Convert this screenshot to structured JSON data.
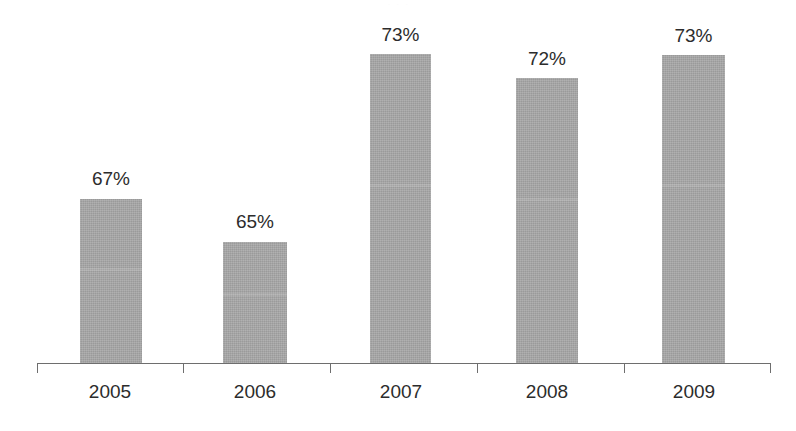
{
  "chart_data": {
    "type": "bar",
    "title": "",
    "subtitle": "",
    "xlabel": "",
    "ylabel": "",
    "categories": [
      "2005",
      "2006",
      "2007",
      "2008",
      "2009"
    ],
    "values": [
      67,
      65,
      73,
      72,
      73
    ],
    "value_labels": [
      "67%",
      "65%",
      "73%",
      "72%",
      "73%"
    ],
    "value_unit": "%",
    "ylim": [
      0,
      100
    ],
    "grid": false,
    "legend": null,
    "series": [
      {
        "name": "",
        "values": [
          67,
          65,
          73,
          72,
          73
        ]
      }
    ],
    "annotations": [],
    "colors": {
      "bar_fill": "#a8a8a8",
      "axis": "#6e6e6e",
      "text": "#2c2c2c",
      "background": "#ffffff"
    },
    "axis": {
      "show_y_axis": false,
      "show_x_axis": true,
      "x_ticks_at_category_boundaries": true
    },
    "geometry": {
      "bar_left_px": [
        80,
        223,
        370,
        516,
        662
      ],
      "bar_width_px": [
        62,
        64,
        61,
        62,
        63
      ],
      "bar_top_px": [
        199,
        242,
        54,
        78,
        55
      ],
      "baseline_y_px": 363,
      "axis_left_px": 37,
      "axis_right_px": 770,
      "tick_x_px": [
        37,
        183,
        330,
        477,
        624,
        770
      ],
      "tick_height_px": 10,
      "label_y_px": 381,
      "value_label_y_px": [
        168,
        211,
        24,
        48,
        25
      ],
      "category_center_px": [
        110,
        255,
        401,
        547,
        694
      ]
    }
  },
  "title_remnant": "· · ·"
}
